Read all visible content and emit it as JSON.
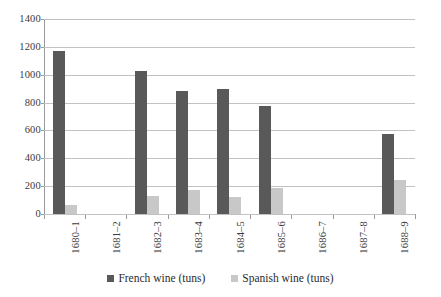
{
  "chart_data": {
    "type": "bar",
    "title": "",
    "subtitle": "",
    "xlabel": "",
    "ylabel": "",
    "ylim": [
      0,
      1400
    ],
    "yticks": [
      0,
      200,
      400,
      600,
      800,
      1000,
      1200,
      1400
    ],
    "ytick_labels": [
      "0",
      "200",
      "400",
      "600",
      "800",
      "1000",
      "1200",
      "1400"
    ],
    "grid": true,
    "legend_position": "bottom",
    "categories": [
      "1680–1",
      "1681–2",
      "1682–3",
      "1683–4",
      "1684–5",
      "1685–6",
      "1686–7",
      "1687–8",
      "1688–9"
    ],
    "series": [
      {
        "name": "French wine (tuns)",
        "color": "#595959",
        "values": [
          1170,
          0,
          1030,
          880,
          895,
          775,
          0,
          0,
          575
        ]
      },
      {
        "name": "Spanish wine (tuns)",
        "color": "#c8c8c8",
        "values": [
          65,
          0,
          130,
          175,
          125,
          190,
          0,
          0,
          245
        ]
      }
    ]
  },
  "legend": {
    "items": [
      {
        "label": "French wine (tuns)",
        "color": "#595959"
      },
      {
        "label": "Spanish wine (tuns)",
        "color": "#c8c8c8"
      }
    ]
  },
  "colors": {
    "french": "#595959",
    "spanish": "#c8c8c8",
    "gridline": "#c2c2c2",
    "axis": "#9a9a9a",
    "text": "#2b2b2b",
    "background": "#ffffff"
  }
}
